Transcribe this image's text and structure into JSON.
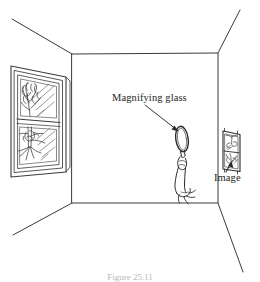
{
  "figure": {
    "caption": "Figure 25.11",
    "labels": {
      "magnifying_glass": "Magnifying glass",
      "image": "Image"
    },
    "colors": {
      "ink": "#2b2b2b",
      "line": "#3a3a3a",
      "light_line": "#6d6d6d",
      "background": "#ffffff",
      "caption": "#b8b8b8"
    },
    "scene": {
      "type": "line-drawing",
      "view": "one-point-perspective room interior",
      "elements": [
        "left-wall",
        "back-wall",
        "right-wall",
        "ceiling",
        "floor",
        "window-with-tree",
        "hand-holding-magnifying-glass",
        "projected-inverted-image-on-right-wall"
      ],
      "room": {
        "back_wall_corners": {
          "top_left": [
            72,
            54
          ],
          "top_right": [
            218,
            53
          ],
          "bottom_right": [
            218,
            203
          ],
          "bottom_left": [
            72,
            203
          ]
        },
        "ceiling_edges": {
          "left_vanish": [
            12,
            19
          ],
          "right_vanish": [
            240,
            10
          ]
        },
        "floor_edges": {
          "left_vanish": [
            13,
            235
          ],
          "right_vanish": [
            243,
            272
          ]
        }
      },
      "window": {
        "panes": 2,
        "contents": [
          "tree",
          "sun-rays"
        ],
        "outer_quad": [
          [
            11,
            66
          ],
          [
            66,
            76
          ],
          [
            66,
            172
          ],
          [
            11,
            177
          ]
        ]
      },
      "magnifying_glass": {
        "lens_center": [
          182,
          138
        ],
        "lens_rx": 6.5,
        "lens_ry": 13,
        "held_by": "hand"
      },
      "projected_image": {
        "frame": [
          [
            223,
            130
          ],
          [
            240,
            134
          ],
          [
            240,
            172
          ],
          [
            223,
            170
          ]
        ],
        "orientation": "inverted",
        "contents": [
          "tree",
          "window-panes"
        ]
      }
    }
  }
}
